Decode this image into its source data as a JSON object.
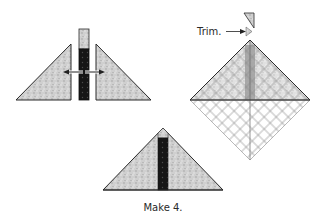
{
  "figure": {
    "step1": {
      "description": "Two fabric triangles pulled apart with a vertical strip inserted between",
      "arrows": [
        "left",
        "right"
      ]
    },
    "step2": {
      "trim_label": "Trim.",
      "description": "Assembled triangle on cutting grid with excess strip end trimmed"
    },
    "step3": {
      "caption": "Make 4.",
      "description": "Finished triangle unit with dark center strip"
    },
    "colors": {
      "fabric_light": "#c9c9c9",
      "fabric_dark": "#1a1a1a",
      "outline": "#2a2a2a",
      "grid_line": "#7a7a7a",
      "strip_shadow": "#5c5c5c"
    }
  }
}
